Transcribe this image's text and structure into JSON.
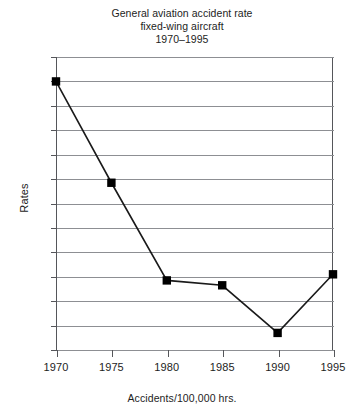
{
  "chart_data": {
    "type": "line",
    "title": "General aviation accident rate\nfixed-wing aircraft\n1970–1995",
    "title_lines": [
      "General aviation accident rate",
      "fixed-wing aircraft",
      "1970–1995"
    ],
    "xlabel": "Accidents/100,000 hrs.",
    "ylabel": "Rates",
    "x": [
      1970,
      1975,
      1980,
      1985,
      1990,
      1995
    ],
    "categories": [
      "1970",
      "1975",
      "1980",
      "1985",
      "1990",
      "1995"
    ],
    "values": [
      18.0,
      13.85,
      9.85,
      9.65,
      7.7,
      10.1
    ],
    "series": [
      {
        "name": "Rates",
        "values": [
          18.0,
          13.85,
          9.85,
          9.65,
          7.7,
          10.1
        ],
        "marker": "square",
        "marker_color": "#000000",
        "line_color": "#1a1a1a"
      }
    ],
    "xlim": [
      1970,
      1995
    ],
    "ylim": [
      7,
      19
    ],
    "xticks": [
      1970,
      1975,
      1980,
      1985,
      1990,
      1995
    ],
    "xtick_labels": [
      "1970",
      "1975",
      "1980",
      "1985",
      "1990",
      "1995"
    ],
    "yticks": [
      7,
      8,
      9,
      10,
      11,
      12,
      13,
      14,
      15,
      16,
      17,
      18,
      19
    ],
    "ytick_labels": [
      "7",
      "8",
      "9",
      "10",
      "11",
      "12",
      "13",
      "14",
      "15",
      "16",
      "17",
      "18",
      "19"
    ],
    "grid": true,
    "grid_axis": "y",
    "legend": false,
    "legend_position": "none",
    "annotations": [],
    "colors": {
      "line": "#1a1a1a",
      "marker": "#000000",
      "gridline": "#8d8f93",
      "axis": "#55565a",
      "text": "#1d1d1d",
      "background": "#ffffff"
    }
  }
}
